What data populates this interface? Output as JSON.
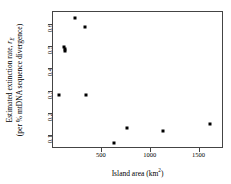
{
  "chart_data": {
    "type": "scatter",
    "title": "",
    "xlabel": "Island area (km2)",
    "xlabel_main": "Island area (km",
    "xlabel_sup": "2",
    "xlabel_tail": ")",
    "ylabel_line1": "Estimated extinction rate, rE",
    "ylabel_line1_main": "Estimated extinction rate, ",
    "ylabel_line1_italic": "r",
    "ylabel_line1_sub": "E",
    "ylabel_line2": "(per % mtDNA sequence divergence)",
    "xlim": [
      0,
      1750
    ],
    "ylim": [
      0.04,
      0.66
    ],
    "xticks": [
      500,
      1000,
      1500
    ],
    "xtick_labels": [
      "500",
      "1000",
      "1500"
    ],
    "yticks": [
      0.6,
      0.5,
      0.4,
      0.3,
      0.2,
      0.1
    ],
    "ytick_labels": [
      "0.6",
      "0.5",
      "0.4",
      "0.3",
      "0.2",
      "0.1"
    ],
    "grid": false,
    "legend": "none",
    "marker": "filled-square",
    "marker_color": "#000000",
    "points": [
      {
        "x": 230,
        "y": 0.635
      },
      {
        "x": 330,
        "y": 0.59
      },
      {
        "x": 110,
        "y": 0.5
      },
      {
        "x": 120,
        "y": 0.492
      },
      {
        "x": 125,
        "y": 0.485
      },
      {
        "x": 60,
        "y": 0.283
      },
      {
        "x": 340,
        "y": 0.283
      },
      {
        "x": 620,
        "y": 0.067
      },
      {
        "x": 760,
        "y": 0.133
      },
      {
        "x": 1125,
        "y": 0.123
      },
      {
        "x": 1610,
        "y": 0.153
      }
    ]
  }
}
